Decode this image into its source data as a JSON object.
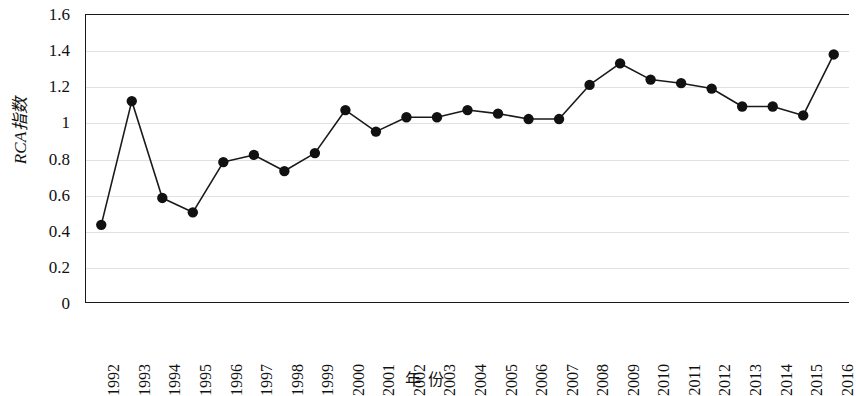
{
  "chart_data": {
    "type": "line",
    "title": "",
    "xlabel": "年  份",
    "ylabel": "RCA指数",
    "ylim": [
      0,
      1.6
    ],
    "yticks": [
      0,
      0.2,
      0.4,
      0.6,
      0.8,
      1,
      1.2,
      1.4,
      1.6
    ],
    "ytick_labels": [
      "0",
      "0.2",
      "0.4",
      "0.6",
      "0.8",
      "1",
      "1.2",
      "1.4",
      "1.6"
    ],
    "grid": "horizontal",
    "legend": "none",
    "marker": "filled-circle",
    "line_color": "#1a1a1a",
    "marker_color": "#111111",
    "grid_color": "#e2e2e6",
    "categories": [
      "1992",
      "1993",
      "1994",
      "1995",
      "1996",
      "1997",
      "1998",
      "1999",
      "2000",
      "2001",
      "2002",
      "2003",
      "2004",
      "2005",
      "2006",
      "2007",
      "2008",
      "2009",
      "2010",
      "2011",
      "2012",
      "2013",
      "2014",
      "2015",
      "2016"
    ],
    "values": [
      0.43,
      1.12,
      0.58,
      0.5,
      0.78,
      0.82,
      0.73,
      0.83,
      1.07,
      0.95,
      1.03,
      1.03,
      1.07,
      1.05,
      1.02,
      1.02,
      1.21,
      1.33,
      1.24,
      1.22,
      1.19,
      1.09,
      1.09,
      1.04,
      1.38
    ]
  }
}
